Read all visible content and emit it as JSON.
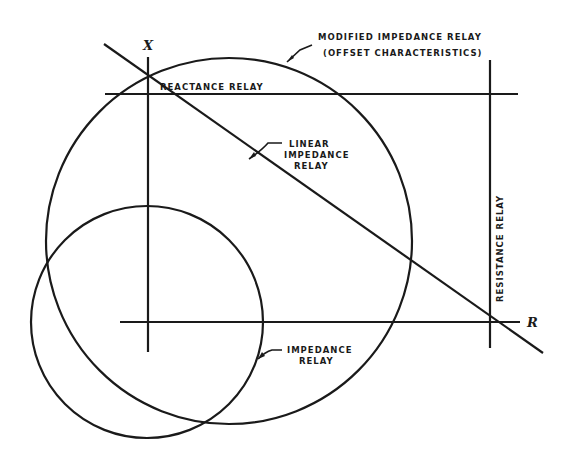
{
  "diagram": {
    "type": "relay characteristics on R-X diagram",
    "axes": {
      "vertical_label": "X",
      "horizontal_label": "R"
    },
    "labels": {
      "modified_line1": "MODIFIED IMPEDANCE RELAY",
      "modified_line2": "(OFFSET CHARACTERISTICS)",
      "reactance": "REACTANCE RELAY",
      "linear_line1": "LINEAR",
      "linear_line2": "IMPEDANCE",
      "linear_line3": "RELAY",
      "resistance": "RESISTANCE RELAY",
      "impedance_line1": "IMPEDANCE",
      "impedance_line2": "RELAY"
    },
    "line_color": "#1a1a1a",
    "background": "#ffffff"
  }
}
